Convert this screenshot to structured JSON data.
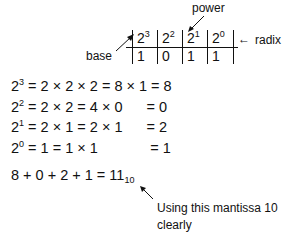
{
  "labels": {
    "power": "power",
    "base": "base",
    "radix": "radix",
    "radix_arrow": "←"
  },
  "table": {
    "headers": [
      {
        "base": "2",
        "exp": "3"
      },
      {
        "base": "2",
        "exp": "2"
      },
      {
        "base": "2",
        "exp": "1"
      },
      {
        "base": "2",
        "exp": "0"
      }
    ],
    "values": [
      "1",
      "0",
      "1",
      "1"
    ]
  },
  "equations": [
    {
      "base": "2",
      "exp": "3",
      "rest": " = 2 × 2 × 2 = 8 × 1 = 8"
    },
    {
      "base": "2",
      "exp": "2",
      "rest": " = 2 × 2 = 4 × 0      = 0"
    },
    {
      "base": "2",
      "exp": "1",
      "rest": " = 2 × 1 = 2 × 1      = 2"
    },
    {
      "base": "2",
      "exp": "0",
      "rest": " = 1 = 1 × 1             = 1"
    }
  ],
  "sum": {
    "expression": "8 + 0 + 2 + 1 = 11",
    "subscript": "10"
  },
  "note": {
    "line1": "Using this mantissa 10 clearly",
    "line2": "identifies the system base."
  }
}
